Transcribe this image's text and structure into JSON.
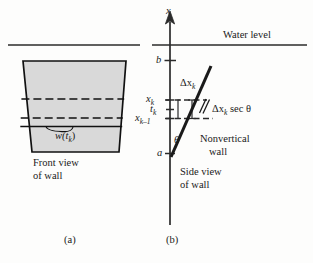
{
  "figure": {
    "panels": [
      {
        "id": "a",
        "caption": "(a)",
        "view_label_line1": "Front view",
        "view_label_line2": "of wall",
        "strip_width_label": "w(t",
        "strip_width_sub": "k",
        "strip_width_close": ")"
      },
      {
        "id": "b",
        "caption": "(b)",
        "view_label_line1": "Side view",
        "view_label_line2": "of wall",
        "wall_label_line1": "Nonvertical",
        "wall_label_line2": "wall",
        "water_level_label": "Water level",
        "axis_label": "x",
        "delta_x_label": "Δx",
        "delta_x_sub": "k",
        "delta_x_sec_label": "Δx",
        "delta_x_sec_sub": "k",
        "delta_x_sec_rest": " sec θ",
        "theta_label": "θ",
        "ticks": [
          {
            "name": "b",
            "label": "b"
          },
          {
            "name": "x-k",
            "label": "x",
            "sub": "k"
          },
          {
            "name": "t-k",
            "label": "t",
            "sub": "k"
          },
          {
            "name": "x-k-minus-1",
            "label": "x",
            "sub": "k–1"
          },
          {
            "name": "a",
            "label": "a"
          }
        ]
      }
    ],
    "colors": {
      "ink": "#1a1a1a",
      "fill": "#d8d8d8",
      "rule": "#2b2b2b"
    }
  }
}
